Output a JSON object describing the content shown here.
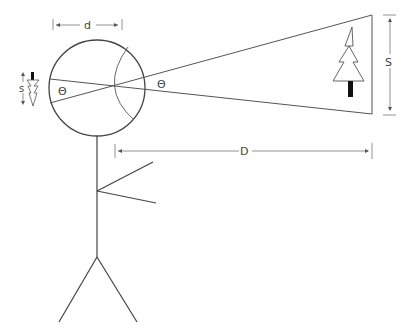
{
  "diagram": {
    "labels": {
      "eye_diameter": "d",
      "object_size_image": "s",
      "angle_inside": "Θ",
      "angle_outside": "Θ",
      "object_size": "S",
      "distance": "D"
    },
    "colors": {
      "line": "#444444",
      "dim_line": "#777777",
      "trunk": "#111111"
    }
  }
}
